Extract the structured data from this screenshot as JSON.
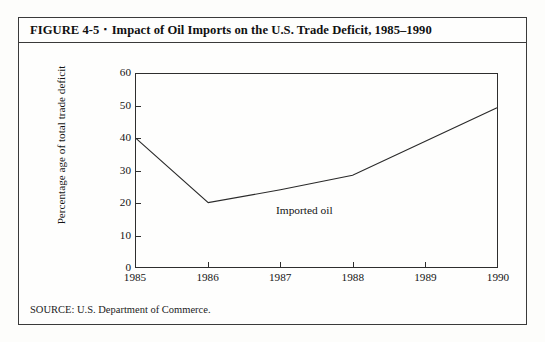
{
  "figure": {
    "number_label": "FIGURE 4-5",
    "bullet": "▪",
    "title_text": "Impact of Oil Imports on the U.S. Trade Deficit, 1985–1990",
    "source": "SOURCE: U.S. Department of Commerce."
  },
  "chart_data": {
    "type": "line",
    "title": "Impact of Oil Imports on the U.S. Trade Deficit, 1985–1990",
    "xlabel": "",
    "ylabel": "Percentage age of total trade deficit",
    "x": [
      1985,
      1986,
      1987,
      1988,
      1989,
      1990
    ],
    "xticklabels": [
      "1985",
      "1986",
      "1987",
      "1988",
      "1989",
      "1990"
    ],
    "yticks": [
      0,
      10,
      20,
      30,
      40,
      50,
      60
    ],
    "yticklabels": [
      "0",
      "10",
      "20",
      "30",
      "40",
      "50",
      "60"
    ],
    "xlim": [
      1985,
      1990
    ],
    "ylim": [
      0,
      60
    ],
    "grid": false,
    "legend": "none",
    "series": [
      {
        "name": "Imported oil",
        "annotation": "Imported oil",
        "color": "#2a2a2a",
        "values": [
          40,
          20,
          24,
          28.5,
          39,
          49.5
        ]
      }
    ]
  }
}
